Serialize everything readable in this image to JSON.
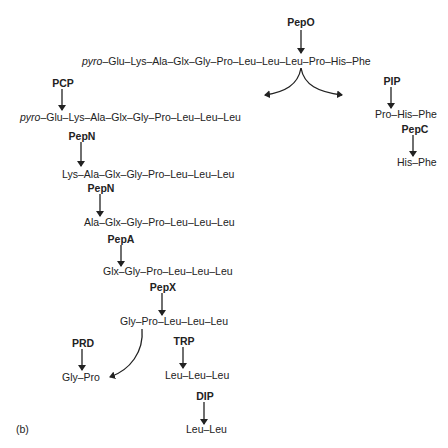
{
  "panel_label": "(b)",
  "enzymes": {
    "pepo": "PepO",
    "pcp": "PCP",
    "pip": "PIP",
    "pepc": "PepC",
    "pepn1": "PepN",
    "pepn2": "PepN",
    "pepa": "PepA",
    "pepx": "PepX",
    "prd": "PRD",
    "trp": "TRP",
    "dip": "DIP"
  },
  "peptides": {
    "substrate": {
      "prefix": "pyro",
      "chain": "–Glu–Lys–Ala–Glx–Gly–Pro–Leu–Leu–Leu–Pro–His–Phe"
    },
    "pcp_substrate": {
      "prefix": "pyro",
      "chain": "–Glu–Lys–Ala–Glx–Gly–Pro–Leu–Leu–Leu"
    },
    "pepo_right_product": "Pro–His–Phe",
    "pepc_product": "His–Phe",
    "pepn1_product": "Lys–Ala–Glx–Gly–Pro–Leu–Leu–Leu",
    "pepn2_product": "Ala–Glx–Gly–Pro–Leu–Leu–Leu",
    "pepa_product": "Glx–Gly–Pro–Leu–Leu–Leu",
    "pepx_product": "Gly–Pro–Leu–Leu–Leu",
    "prd_substrate": "Gly–Pro",
    "trp_substrate": "Leu–Leu–Leu",
    "dip_product": "Leu–Leu"
  },
  "colors": {
    "ink": "#222222",
    "background": "#ffffff"
  }
}
